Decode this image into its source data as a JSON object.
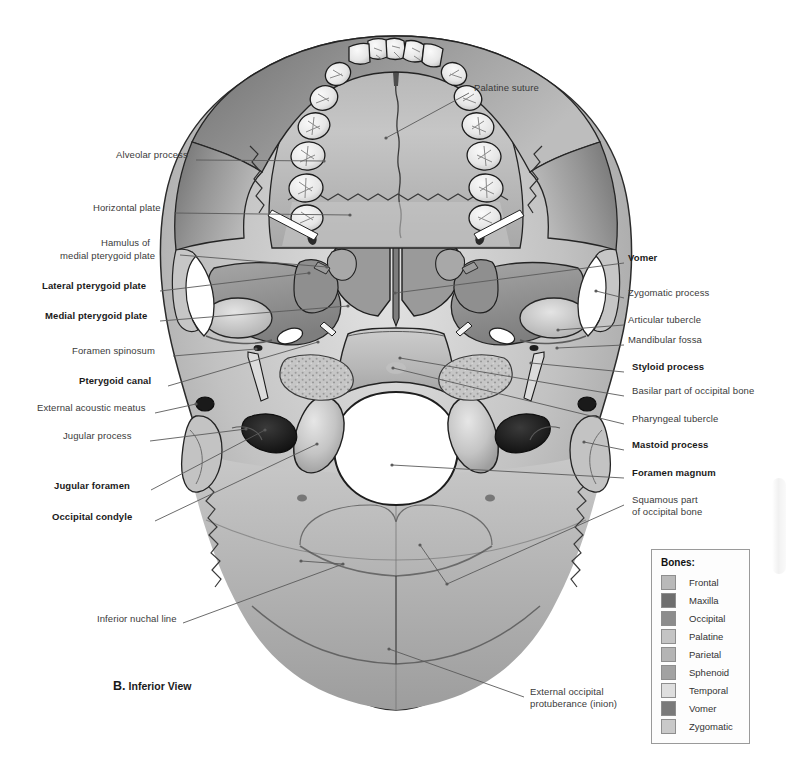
{
  "figure": {
    "caption_letter": "B.",
    "caption_text": "Inferior View"
  },
  "labels_left": [
    {
      "name": "alveolar-process",
      "text": "Alveolar process",
      "bold": false,
      "x": 116,
      "y": 155,
      "lx": 196,
      "ly": 160,
      "tx": 324,
      "ty": 161
    },
    {
      "name": "horizontal-plate",
      "text": "Horizontal plate",
      "bold": false,
      "x": 93,
      "y": 208,
      "lx": 174,
      "ly": 213,
      "tx": 350,
      "ty": 215
    },
    {
      "name": "hamulus-medial-pterygoid",
      "text": "Hamulus of",
      "bold": false,
      "x": 101,
      "y": 243,
      "lx": 180,
      "ly": 255,
      "tx": 327,
      "ty": 267
    },
    {
      "name": "hamulus-medial-pterygoid-2",
      "text": "medial pterygoid plate",
      "bold": false,
      "x": 60,
      "y": 256
    },
    {
      "name": "lateral-pterygoid-plate",
      "text": "Lateral pterygoid plate",
      "bold": true,
      "x": 42,
      "y": 286,
      "lx": 160,
      "ly": 291,
      "tx": 309,
      "ty": 273
    },
    {
      "name": "medial-pterygoid-plate",
      "text": "Medial pterygoid plate",
      "bold": true,
      "x": 45,
      "y": 316,
      "lx": 160,
      "ly": 321,
      "tx": 348,
      "ty": 306
    },
    {
      "name": "foramen-spinosum",
      "text": "Foramen spinosum",
      "bold": false,
      "x": 72,
      "y": 351,
      "lx": 173,
      "ly": 356,
      "tx": 256,
      "ty": 349
    },
    {
      "name": "pterygoid-canal",
      "text": "Pterygoid canal",
      "bold": true,
      "x": 79,
      "y": 381,
      "lx": 168,
      "ly": 386,
      "tx": 318,
      "ty": 342
    },
    {
      "name": "external-acoustic-meatus",
      "text": "External acoustic meatus",
      "bold": false,
      "x": 37,
      "y": 408,
      "lx": 155,
      "ly": 413,
      "tx": 196,
      "ty": 404
    },
    {
      "name": "jugular-process",
      "text": "Jugular process",
      "bold": false,
      "x": 63,
      "y": 436,
      "lx": 150,
      "ly": 441,
      "tx": 246,
      "ty": 429
    },
    {
      "name": "jugular-foramen",
      "text": "Jugular foramen",
      "bold": true,
      "x": 54,
      "y": 486,
      "lx": 151,
      "ly": 490,
      "tx": 265,
      "ty": 430
    },
    {
      "name": "occipital-condyle",
      "text": "Occipital condyle",
      "bold": true,
      "x": 52,
      "y": 517,
      "lx": 155,
      "ly": 521,
      "tx": 317,
      "ty": 444
    },
    {
      "name": "inferior-nuchal-line",
      "text": "Inferior nuchal line",
      "bold": false,
      "x": 97,
      "y": 619,
      "lx": 183,
      "ly": 623,
      "tx": 343,
      "ty": 564
    }
  ],
  "labels_right": [
    {
      "name": "palatine-suture",
      "text": "Palatine suture",
      "bold": false,
      "x": 474,
      "y": 88,
      "lx": 469,
      "ly": 93,
      "tx": 386,
      "ty": 138
    },
    {
      "name": "vomer",
      "text": "Vomer",
      "bold": true,
      "x": 628,
      "y": 258,
      "lx": 624,
      "ly": 263,
      "tx": 395,
      "ty": 293
    },
    {
      "name": "zygomatic-process",
      "text": "Zygomatic process",
      "bold": false,
      "x": 628,
      "y": 293,
      "lx": 624,
      "ly": 298,
      "tx": 596,
      "ty": 291
    },
    {
      "name": "articular-tubercle",
      "text": "Articular tubercle",
      "bold": false,
      "x": 628,
      "y": 320,
      "lx": 624,
      "ly": 325,
      "tx": 558,
      "ty": 330
    },
    {
      "name": "mandibular-fossa",
      "text": "Mandibular fossa",
      "bold": false,
      "x": 628,
      "y": 340,
      "lx": 624,
      "ly": 345,
      "tx": 557,
      "ty": 348
    },
    {
      "name": "styloid-process",
      "text": "Styloid process",
      "bold": true,
      "x": 632,
      "y": 367,
      "lx": 624,
      "ly": 372,
      "tx": 531,
      "ty": 363
    },
    {
      "name": "basilar-part-occipital",
      "text": "Basilar part of occipital bone",
      "bold": false,
      "x": 632,
      "y": 391,
      "lx": 624,
      "ly": 396,
      "tx": 400,
      "ty": 358
    },
    {
      "name": "pharyngeal-tubercle",
      "text": "Pharyngeal tubercle",
      "bold": false,
      "x": 632,
      "y": 419,
      "lx": 624,
      "ly": 424,
      "tx": 393,
      "ty": 368
    },
    {
      "name": "mastoid-process",
      "text": "Mastoid process",
      "bold": true,
      "x": 632,
      "y": 445,
      "lx": 624,
      "ly": 450,
      "tx": 584,
      "ty": 442
    },
    {
      "name": "foramen-magnum",
      "text": "Foramen magnum",
      "bold": true,
      "x": 632,
      "y": 473,
      "lx": 624,
      "ly": 478,
      "tx": 392,
      "ty": 465
    },
    {
      "name": "squamous-part-occipital",
      "text": "Squamous part",
      "bold": false,
      "x": 632,
      "y": 500,
      "lx": 624,
      "ly": 505,
      "tx": 447,
      "ty": 584
    },
    {
      "name": "squamous-part-occipital-2",
      "text": "of occipital bone",
      "bold": false,
      "x": 632,
      "y": 512
    },
    {
      "name": "external-occipital-protuberance",
      "text": "External occipital",
      "bold": false,
      "x": 530,
      "y": 692,
      "lx": 524,
      "ly": 697,
      "tx": 389,
      "ty": 649
    },
    {
      "name": "external-occipital-protuberance-2",
      "text": "protuberance (inion)",
      "bold": false,
      "x": 530,
      "y": 704
    }
  ],
  "extra_leaders": [
    {
      "name": "leader-nuchal-branch",
      "x1": 343,
      "y1": 564,
      "x2": 301,
      "y2": 561
    },
    {
      "name": "leader-squamous-branch",
      "x1": 447,
      "y1": 584,
      "x2": 420,
      "y2": 545
    }
  ],
  "legend": {
    "title": "Bones:",
    "items": [
      {
        "name": "Frontal",
        "color": "#b9b9b9"
      },
      {
        "name": "Maxilla",
        "color": "#6e6e6e"
      },
      {
        "name": "Occipital",
        "color": "#8c8c8c"
      },
      {
        "name": "Palatine",
        "color": "#c4c4c4"
      },
      {
        "name": "Parietal",
        "color": "#b4b4b4"
      },
      {
        "name": "Sphenoid",
        "color": "#a2a2a2"
      },
      {
        "name": "Temporal",
        "color": "#dedede"
      },
      {
        "name": "Vomer",
        "color": "#7a7a7a"
      },
      {
        "name": "Zygomatic",
        "color": "#c9c9c9"
      }
    ]
  },
  "palette": {
    "bone_light": "#d8d8d8",
    "bone_mid": "#b3b3b3",
    "bone_dark": "#8a8a8a",
    "bone_shadow": "#5d5d5d",
    "tooth": "#ececec",
    "outline": "#2b2b2b",
    "foramen_white": "#ffffff",
    "background": "#ffffff",
    "leader": "#5a5a5a"
  }
}
